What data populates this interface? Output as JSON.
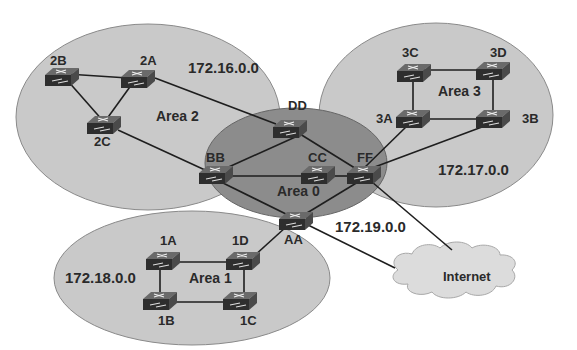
{
  "diagram": {
    "colors": {
      "area_fill": "#c9c9c9",
      "area_stroke": "#8a8a8a",
      "backbone_fill": "#8c8c8c",
      "router_fill": "#3a3a3a",
      "link": "#1e1e1e",
      "cloud_fill": "#dcdcdc"
    },
    "areas": [
      {
        "id": "area2",
        "label": "Area 2",
        "network": "172.16.0.0"
      },
      {
        "id": "area3",
        "label": "Area 3",
        "network": "172.17.0.0"
      },
      {
        "id": "area1",
        "label": "Area 1",
        "network": "172.18.0.0"
      },
      {
        "id": "area0",
        "label": "Area 0",
        "network": "172.19.0.0"
      }
    ],
    "routers": [
      {
        "id": "2A",
        "label": "2A",
        "area": "Area 2"
      },
      {
        "id": "2B",
        "label": "2B",
        "area": "Area 2"
      },
      {
        "id": "2C",
        "label": "2C",
        "area": "Area 2"
      },
      {
        "id": "3A",
        "label": "3A",
        "area": "Area 3"
      },
      {
        "id": "3B",
        "label": "3B",
        "area": "Area 3"
      },
      {
        "id": "3C",
        "label": "3C",
        "area": "Area 3"
      },
      {
        "id": "3D",
        "label": "3D",
        "area": "Area 3"
      },
      {
        "id": "1A",
        "label": "1A",
        "area": "Area 1"
      },
      {
        "id": "1B",
        "label": "1B",
        "area": "Area 1"
      },
      {
        "id": "1C",
        "label": "1C",
        "area": "Area 1"
      },
      {
        "id": "1D",
        "label": "1D",
        "area": "Area 1"
      },
      {
        "id": "AA",
        "label": "AA",
        "area": "Area 0"
      },
      {
        "id": "BB",
        "label": "BB",
        "area": "Area 0"
      },
      {
        "id": "CC",
        "label": "CC",
        "area": "Area 0"
      },
      {
        "id": "DD",
        "label": "DD",
        "area": "Area 0"
      },
      {
        "id": "FF",
        "label": "FF",
        "area": "Area 0"
      }
    ],
    "links": [
      [
        "2B",
        "2A"
      ],
      [
        "2B",
        "2C"
      ],
      [
        "2A",
        "2C"
      ],
      [
        "2A",
        "DD"
      ],
      [
        "2C",
        "BB"
      ],
      [
        "3C",
        "3D"
      ],
      [
        "3C",
        "3A"
      ],
      [
        "3D",
        "3B"
      ],
      [
        "3A",
        "3B"
      ],
      [
        "3A",
        "FF"
      ],
      [
        "3B",
        "FF"
      ],
      [
        "1A",
        "1D"
      ],
      [
        "1A",
        "1B"
      ],
      [
        "1B",
        "1C"
      ],
      [
        "1D",
        "1C"
      ],
      [
        "1D",
        "AA"
      ],
      [
        "DD",
        "BB"
      ],
      [
        "DD",
        "FF"
      ],
      [
        "BB",
        "CC"
      ],
      [
        "CC",
        "FF"
      ],
      [
        "BB",
        "AA"
      ],
      [
        "FF",
        "AA"
      ],
      [
        "AA",
        "Internet"
      ],
      [
        "FF",
        "Internet"
      ]
    ],
    "cloud": {
      "label": "Internet"
    }
  }
}
